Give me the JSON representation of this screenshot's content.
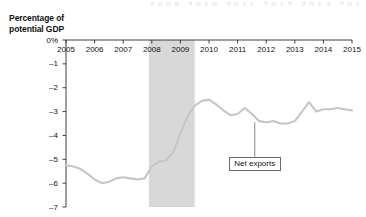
{
  "chart_data": {
    "type": "line",
    "title": "",
    "ylabel": "Percentage of potential GDP",
    "xlabel": "",
    "ylim": [
      -7,
      0
    ],
    "xlim": [
      2005,
      2015
    ],
    "grid": false,
    "legend_position": "inline-callout",
    "y_tick_labels": [
      "0%",
      "-1",
      "-2",
      "-3",
      "-4",
      "-5",
      "-6",
      "-7"
    ],
    "y_tick_values": [
      0,
      -1,
      -2,
      -3,
      -4,
      -5,
      -6,
      -7
    ],
    "x_tick_labels": [
      "2005",
      "2006",
      "2007",
      "2008",
      "2009",
      "2010",
      "2011",
      "2012",
      "2013",
      "2014",
      "2015"
    ],
    "x_tick_values": [
      2005,
      2006,
      2007,
      2008,
      2009,
      2010,
      2011,
      2012,
      2013,
      2014,
      2015
    ],
    "annotations": [
      {
        "name": "net-exports-callout",
        "label": "Net exports",
        "points_to_x": 2011.6,
        "points_to_y": -3.45
      }
    ],
    "shaded_regions": [
      {
        "name": "recession-band",
        "x_start": 2007.9,
        "x_end": 2009.5,
        "color": "#d8d8d8"
      }
    ],
    "series": [
      {
        "name": "Net exports",
        "color": "#c6c6c6",
        "x": [
          2005.0,
          2005.25,
          2005.5,
          2005.75,
          2006.0,
          2006.25,
          2006.5,
          2006.75,
          2007.0,
          2007.25,
          2007.5,
          2007.75,
          2008.0,
          2008.25,
          2008.5,
          2008.75,
          2009.0,
          2009.25,
          2009.5,
          2009.75,
          2010.0,
          2010.25,
          2010.5,
          2010.75,
          2011.0,
          2011.25,
          2011.5,
          2011.75,
          2012.0,
          2012.25,
          2012.5,
          2012.75,
          2013.0,
          2013.25,
          2013.5,
          2013.75,
          2014.0,
          2014.25,
          2014.5,
          2014.75,
          2015.0
        ],
        "y": [
          -5.25,
          -5.3,
          -5.4,
          -5.6,
          -5.85,
          -6.0,
          -5.95,
          -5.8,
          -5.75,
          -5.8,
          -5.85,
          -5.8,
          -5.3,
          -5.1,
          -5.05,
          -4.7,
          -3.9,
          -3.2,
          -2.75,
          -2.55,
          -2.5,
          -2.7,
          -2.95,
          -3.15,
          -3.1,
          -2.85,
          -3.1,
          -3.4,
          -3.45,
          -3.4,
          -3.5,
          -3.5,
          -3.4,
          -3.0,
          -2.6,
          -3.0,
          -2.9,
          -2.9,
          -2.85,
          -2.9,
          -2.95
        ]
      }
    ]
  },
  "bleed_text": "2009 2010 2011 2012 2013 2014 2015"
}
